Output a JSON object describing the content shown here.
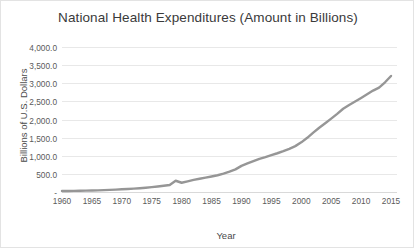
{
  "chart_data": {
    "type": "line",
    "title": "National Health Expenditures (Amount in Billions)",
    "xlabel": "Year",
    "ylabel": "Billions of U.S. Dollars",
    "xlim": [
      1960,
      2016
    ],
    "ylim": [
      0,
      4000
    ],
    "grid": true,
    "legend": "none",
    "line_color": "#969696",
    "x_tick_labels": [
      "1960",
      "1965",
      "1970",
      "1975",
      "1980",
      "1985",
      "1990",
      "1995",
      "2000",
      "2005",
      "2010",
      "2015"
    ],
    "x_ticks": [
      1960,
      1965,
      1970,
      1975,
      1980,
      1985,
      1990,
      1995,
      2000,
      2005,
      2010,
      2015
    ],
    "y_tick_labels": [
      "-",
      "500.0",
      "1,000.0",
      "1,500.0",
      "2,000.0",
      "2,500.0",
      "3,000.0",
      "3,500.0",
      "4,000.0"
    ],
    "y_ticks": [
      0,
      500,
      1000,
      1500,
      2000,
      2500,
      3000,
      3500,
      4000
    ],
    "series": [
      {
        "name": "National Health Expenditures",
        "x": [
          1960,
          1961,
          1962,
          1963,
          1964,
          1965,
          1966,
          1967,
          1968,
          1969,
          1970,
          1971,
          1972,
          1973,
          1974,
          1975,
          1976,
          1977,
          1978,
          1979,
          1980,
          1981,
          1982,
          1983,
          1984,
          1985,
          1986,
          1987,
          1988,
          1989,
          1990,
          1991,
          1992,
          1993,
          1994,
          1995,
          1996,
          1997,
          1998,
          1999,
          2000,
          2001,
          2002,
          2003,
          2004,
          2005,
          2006,
          2007,
          2008,
          2009,
          2010,
          2011,
          2012,
          2013,
          2014,
          2015
        ],
        "values": [
          27.2,
          29.1,
          31.8,
          34.6,
          38.4,
          41.9,
          46.1,
          51.6,
          58.4,
          65.9,
          74.6,
          82.7,
          92.7,
          102.5,
          116.1,
          133.3,
          152.9,
          173.9,
          194.7,
          310.0,
          255.3,
          295.1,
          333.2,
          364.5,
          397.1,
          428.2,
          463.0,
          506.2,
          562.4,
          623.9,
          721.4,
          788.1,
          854.1,
          915.0,
          962.8,
          1016.5,
          1068.8,
          1125.3,
          1190.1,
          1265.3,
          1369.7,
          1495.3,
          1637.0,
          1772.2,
          1895.9,
          2024.2,
          2156.5,
          2295.7,
          2399.1,
          2495.1,
          2593.6,
          2696.0,
          2797.3,
          2879.0,
          3026.2,
          3200.8
        ]
      }
    ]
  }
}
